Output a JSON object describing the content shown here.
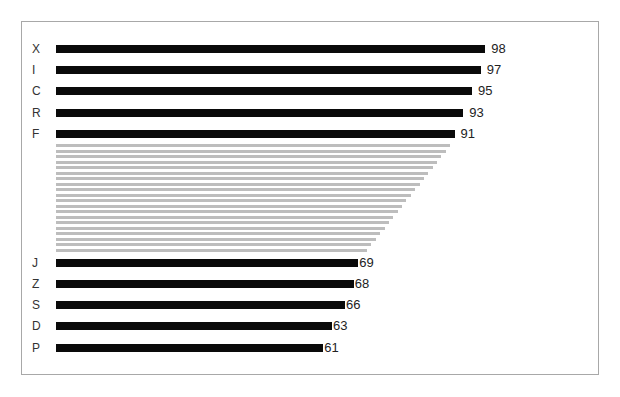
{
  "chart_data": {
    "type": "bar",
    "orientation": "horizontal",
    "title": "",
    "xlabel": "",
    "ylabel": "",
    "categories": [
      "X",
      "I",
      "C",
      "R",
      "F",
      "J",
      "Z",
      "S",
      "D",
      "P"
    ],
    "values": [
      98,
      97,
      95,
      93,
      91,
      69,
      68,
      66,
      63,
      61
    ],
    "value_labels": [
      "98",
      "97",
      "95",
      "93",
      "91",
      "69",
      "68",
      "66",
      "63",
      "61"
    ],
    "grid": false,
    "legend": null,
    "annotations": [
      "Omitted intermediate bars shown as faded gray lines between F (91) and J (69)"
    ],
    "bar_color": "#0a0a0a",
    "omitted_bar_color": "#bdbdbd",
    "omitted_bar_count": 20,
    "xlim": [
      0,
      100
    ]
  },
  "layout": {
    "bar_left": 56,
    "px_per_unit": 4.38,
    "top_rows_y": [
      45,
      66,
      87,
      109,
      130
    ],
    "bottom_rows_y": [
      259,
      280,
      301,
      322,
      344
    ],
    "gray_start_y": 144,
    "gray_spacing": 5.5,
    "gray_start_value": 90,
    "gray_end_value": 71
  }
}
